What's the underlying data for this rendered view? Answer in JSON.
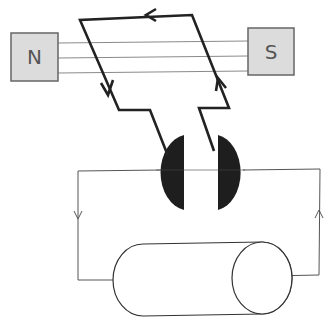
{
  "diagram": {
    "type": "DC generator / motor schematic",
    "magnets": {
      "north": {
        "label": "N",
        "fill": "#dcdcdc",
        "stroke": "#666666"
      },
      "south": {
        "label": "S",
        "fill": "#dcdcdc",
        "stroke": "#666666"
      }
    },
    "field_lines": 3,
    "coil": {
      "stroke": "#222222",
      "arrows": [
        "top-left",
        "left-down",
        "right-up"
      ]
    },
    "commutator": {
      "segments": 2,
      "fill": "#1e1e1e"
    },
    "external_circuit": {
      "stroke": "#555555",
      "arrows": [
        "left-down",
        "right-up"
      ]
    },
    "load": {
      "shape": "cylinder",
      "stroke": "#333333"
    }
  }
}
